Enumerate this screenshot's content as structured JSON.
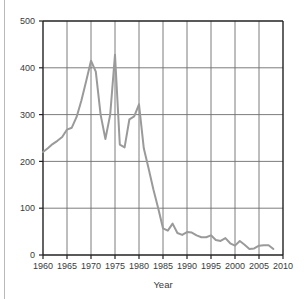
{
  "figure": {
    "background_color": "#ffffff",
    "left_rule_color": "#b9b9b9"
  },
  "chart_data": {
    "type": "line",
    "title": "",
    "subtitle": "",
    "xlabel": "Year",
    "ylabel": "",
    "xlim": [
      1960,
      2010
    ],
    "ylim": [
      0,
      500
    ],
    "grid": true,
    "grid_axis": "both",
    "legend": false,
    "legend_position": "none",
    "line_color": "#9a9a9a",
    "line_width": 2.0,
    "axis_color": "#222222",
    "grid_color": "#6e6e6e",
    "xticks": [
      1960,
      1965,
      1970,
      1975,
      1980,
      1985,
      1990,
      1995,
      2000,
      2005,
      2010
    ],
    "xtick_labels": [
      "1960",
      "1965",
      "1970",
      "1975",
      "1980",
      "1985",
      "1990",
      "1995",
      "2000",
      "2005",
      "2010"
    ],
    "yticks": [
      0,
      100,
      200,
      300,
      400,
      500
    ],
    "ytick_labels": [
      "0",
      "100",
      "200",
      "300",
      "400",
      "500"
    ],
    "series": [
      {
        "name": "value",
        "x": [
          1960,
          1961,
          1962,
          1963,
          1964,
          1965,
          1966,
          1967,
          1968,
          1969,
          1970,
          1971,
          1972,
          1973,
          1974,
          1975,
          1976,
          1977,
          1978,
          1979,
          1980,
          1981,
          1982,
          1983,
          1984,
          1985,
          1986,
          1987,
          1988,
          1989,
          1990,
          1991,
          1992,
          1993,
          1994,
          1995,
          1996,
          1997,
          1998,
          1999,
          2000,
          2001,
          2002,
          2003,
          2004,
          2005,
          2006,
          2007,
          2008
        ],
        "values": [
          220,
          228,
          237,
          244,
          252,
          268,
          272,
          295,
          330,
          372,
          415,
          392,
          300,
          248,
          300,
          428,
          236,
          230,
          290,
          296,
          322,
          228,
          185,
          140,
          100,
          57,
          52,
          67,
          47,
          43,
          49,
          48,
          42,
          38,
          38,
          42,
          32,
          30,
          36,
          25,
          20,
          30,
          22,
          13,
          14,
          20,
          21,
          21,
          13
        ]
      }
    ]
  }
}
